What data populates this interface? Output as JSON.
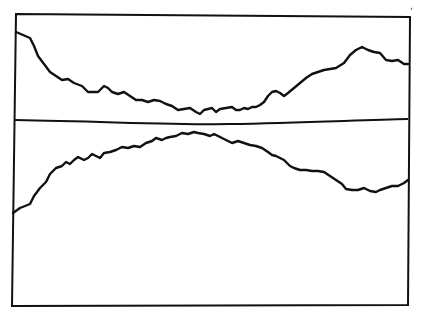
{
  "figure": {
    "corner_mark": ",",
    "colors": {
      "background": "#ffffff",
      "ink": "#111111"
    }
  }
}
